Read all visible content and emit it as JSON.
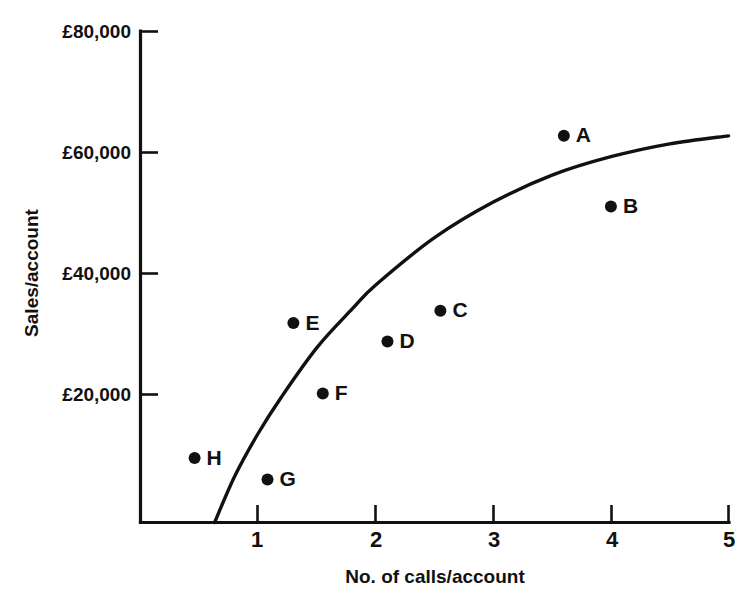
{
  "chart_data": {
    "type": "scatter",
    "title": "",
    "xlabel": "No. of calls/account",
    "ylabel": "Sales/account",
    "xlim": [
      0,
      5
    ],
    "ylim": [
      0,
      80000
    ],
    "grid": false,
    "legend": "none",
    "x_ticks": [
      {
        "value": 1,
        "label": "1"
      },
      {
        "value": 2,
        "label": "2"
      },
      {
        "value": 3,
        "label": "3"
      },
      {
        "value": 4,
        "label": "4"
      },
      {
        "value": 5,
        "label": "5"
      }
    ],
    "y_ticks": [
      {
        "value": 20000,
        "label": "£20,000"
      },
      {
        "value": 40000,
        "label": "£40,000"
      },
      {
        "value": 60000,
        "label": "£60,000"
      },
      {
        "value": 80000,
        "label": "£80,000"
      }
    ],
    "points": [
      {
        "label": "A",
        "x": 3.6,
        "y": 63000,
        "label_side": "right"
      },
      {
        "label": "B",
        "x": 4.0,
        "y": 51500,
        "label_side": "right"
      },
      {
        "label": "C",
        "x": 2.55,
        "y": 34500,
        "label_side": "right"
      },
      {
        "label": "D",
        "x": 2.1,
        "y": 29500,
        "label_side": "right"
      },
      {
        "label": "E",
        "x": 1.3,
        "y": 32500,
        "label_side": "right"
      },
      {
        "label": "F",
        "x": 1.55,
        "y": 21000,
        "label_side": "right"
      },
      {
        "label": "G",
        "x": 1.08,
        "y": 7000,
        "label_side": "right"
      },
      {
        "label": "H",
        "x": 0.46,
        "y": 10500,
        "label_side": "right"
      }
    ],
    "fit_curve": {
      "name": "response-curve",
      "description": "concave increasing response curve",
      "points": [
        {
          "x": 0.63,
          "y": 0
        },
        {
          "x": 0.8,
          "y": 7500
        },
        {
          "x": 1.0,
          "y": 14500
        },
        {
          "x": 1.2,
          "y": 20500
        },
        {
          "x": 1.5,
          "y": 28500
        },
        {
          "x": 1.8,
          "y": 34800
        },
        {
          "x": 2.0,
          "y": 38700
        },
        {
          "x": 2.5,
          "y": 46400
        },
        {
          "x": 3.0,
          "y": 52200
        },
        {
          "x": 3.5,
          "y": 56600
        },
        {
          "x": 4.0,
          "y": 59600
        },
        {
          "x": 4.5,
          "y": 61700
        },
        {
          "x": 5.0,
          "y": 63000
        }
      ]
    },
    "colors": {
      "ink": "#111111",
      "background": "#ffffff"
    }
  }
}
